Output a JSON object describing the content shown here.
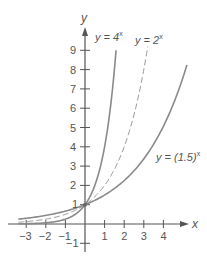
{
  "chart_data": {
    "type": "line",
    "title": "",
    "xlabel": "x",
    "ylabel": "y",
    "xlim": [
      -3.4,
      4.7
    ],
    "ylim": [
      -1.2,
      9.5
    ],
    "grid": false,
    "legend_position": "inline labels",
    "x_ticks": [
      -3,
      -2,
      -1,
      1,
      2,
      3,
      4
    ],
    "x_tick_labels": [
      "−3",
      "−2",
      "−1",
      "1",
      "2",
      "3",
      "4"
    ],
    "y_ticks": [
      -1,
      1,
      2,
      3,
      4,
      5,
      6,
      7,
      8,
      9
    ],
    "y_tick_labels": [
      "−1",
      "1",
      "2",
      "3",
      "4",
      "5",
      "6",
      "7",
      "8",
      "9"
    ],
    "series": [
      {
        "name": "y = 4^x",
        "base": 4,
        "style": "solid",
        "color": "#8a8a8a",
        "x": [
          -3.4,
          -3,
          -2,
          -1,
          0,
          0.5,
          1,
          1.5,
          1.585
        ],
        "values": [
          0.009,
          0.016,
          0.0625,
          0.25,
          1,
          2,
          4,
          8,
          9
        ]
      },
      {
        "name": "y = 2^x",
        "base": 2,
        "style": "dashed",
        "color": "#9a9a9a",
        "x": [
          -3.4,
          -3,
          -2,
          -1,
          0,
          1,
          2,
          3,
          3.2
        ],
        "values": [
          0.095,
          0.125,
          0.25,
          0.5,
          1,
          2,
          4,
          8,
          9.2
        ]
      },
      {
        "name": "y = (1.5)^x",
        "base": 1.5,
        "style": "solid",
        "color": "#8a8a8a",
        "x": [
          -3.4,
          -3,
          -2,
          -1,
          0,
          1,
          2,
          3,
          4,
          5.2
        ],
        "values": [
          0.252,
          0.296,
          0.444,
          0.667,
          1,
          1.5,
          2.25,
          3.375,
          5.0625,
          8.23
        ]
      }
    ],
    "annotations": [
      {
        "text": "y = 4",
        "sup": "x",
        "near": "top of y = 4^x curve"
      },
      {
        "text": "y = 2",
        "sup": "x",
        "near": "top of y = 2^x curve"
      },
      {
        "text": "y = (1.5)",
        "sup": "x",
        "near": "right side of y = (1.5)^x curve"
      },
      {
        "text": "1",
        "near": "intersection point (0, 1)"
      }
    ]
  },
  "labels": {
    "axis_x": "x",
    "axis_y": "y",
    "curve_4": {
      "prefix": "y = 4",
      "sup": "x"
    },
    "curve_2": {
      "prefix": "y = 2",
      "sup": "x"
    },
    "curve_15": {
      "prefix": "y = (1.5)",
      "sup": "x"
    },
    "intercept": "1"
  }
}
